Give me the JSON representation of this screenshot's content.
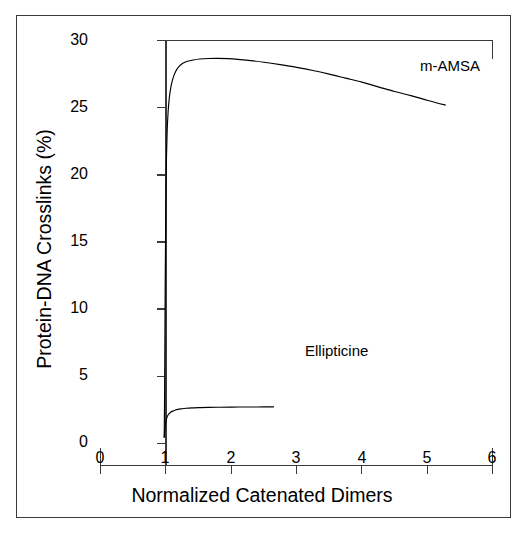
{
  "chart_data": {
    "type": "line",
    "title": "",
    "xlabel": "Normalized Catenated Dimers",
    "ylabel": "Protein-DNA Crosslinks (%)",
    "xlim": [
      0,
      6
    ],
    "ylim": [
      0,
      30
    ],
    "xticks": [
      "0",
      "1",
      "2",
      "3",
      "4",
      "5",
      "6"
    ],
    "xtick_values": [
      0,
      1,
      2,
      3,
      4,
      5,
      6
    ],
    "yticks": [
      "0",
      "5",
      "10",
      "15",
      "20",
      "25",
      "30"
    ],
    "ytick_values": [
      0,
      5,
      10,
      15,
      20,
      25,
      30
    ],
    "grid": false,
    "legend_position": "inline-annotation",
    "line_color": "#000000",
    "frame_color": "#3a3a3a",
    "background": "#ffffff",
    "series": [
      {
        "name": "m-AMSA",
        "label": "m-AMSA",
        "label_x": 4.75,
        "label_y": 28.3,
        "points": [
          [
            0.975,
            0.5
          ],
          [
            0.98,
            3.0
          ],
          [
            0.985,
            7.0
          ],
          [
            0.99,
            11.5
          ],
          [
            0.996,
            15.5
          ],
          [
            1.002,
            18.8
          ],
          [
            1.01,
            21.3
          ],
          [
            1.02,
            23.2
          ],
          [
            1.035,
            24.7
          ],
          [
            1.055,
            25.8
          ],
          [
            1.08,
            26.6
          ],
          [
            1.11,
            27.2
          ],
          [
            1.15,
            27.7
          ],
          [
            1.2,
            28.05
          ],
          [
            1.26,
            28.3
          ],
          [
            1.33,
            28.45
          ],
          [
            1.42,
            28.55
          ],
          [
            1.52,
            28.62
          ],
          [
            1.65,
            28.66
          ],
          [
            1.8,
            28.67
          ],
          [
            1.95,
            28.65
          ],
          [
            2.1,
            28.6
          ],
          [
            2.3,
            28.5
          ],
          [
            2.5,
            28.38
          ],
          [
            2.75,
            28.2
          ],
          [
            3.0,
            28.0
          ],
          [
            3.25,
            27.77
          ],
          [
            3.5,
            27.5
          ],
          [
            3.75,
            27.2
          ],
          [
            4.0,
            26.9
          ],
          [
            4.25,
            26.55
          ],
          [
            4.5,
            26.2
          ],
          [
            4.75,
            25.9
          ],
          [
            5.0,
            25.55
          ],
          [
            5.15,
            25.35
          ],
          [
            5.28,
            25.2
          ]
        ]
      },
      {
        "name": "Ellipticine",
        "label": "Ellipticine",
        "label_x": 3.25,
        "label_y": 3.3,
        "points": [
          [
            0.975,
            0.45
          ],
          [
            0.98,
            0.75
          ],
          [
            0.986,
            1.1
          ],
          [
            0.993,
            1.42
          ],
          [
            1.002,
            1.68
          ],
          [
            1.014,
            1.9
          ],
          [
            1.03,
            2.08
          ],
          [
            1.05,
            2.22
          ],
          [
            1.075,
            2.33
          ],
          [
            1.105,
            2.41
          ],
          [
            1.14,
            2.48
          ],
          [
            1.185,
            2.54
          ],
          [
            1.24,
            2.58
          ],
          [
            1.31,
            2.62
          ],
          [
            1.4,
            2.65
          ],
          [
            1.51,
            2.67
          ],
          [
            1.65,
            2.69
          ],
          [
            1.82,
            2.7
          ],
          [
            2.0,
            2.71
          ],
          [
            2.2,
            2.72
          ],
          [
            2.4,
            2.72
          ],
          [
            2.65,
            2.73
          ]
        ]
      }
    ]
  },
  "axis_titles": {
    "x": "Normalized Catenated Dimers",
    "y": "Protein-DNA Crosslinks (%)"
  }
}
